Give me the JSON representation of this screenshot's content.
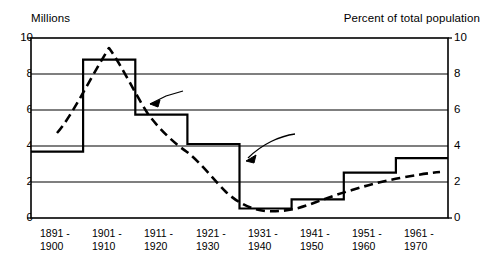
{
  "chart_data": {
    "type": "line",
    "title": "",
    "categories": [
      "1891 -\n1900",
      "1901 -\n1910",
      "1911 -\n1920",
      "1921 -\n1930",
      "1931 -\n1940",
      "1941 -\n1950",
      "1951 -\n1960",
      "1961 -\n1970"
    ],
    "category_lines": [
      [
        "1891 -",
        "1900"
      ],
      [
        "1901 -",
        "1910"
      ],
      [
        "1911 -",
        "1920"
      ],
      [
        "1921 -",
        "1930"
      ],
      [
        "1931 -",
        "1940"
      ],
      [
        "1941 -",
        "1950"
      ],
      [
        "1951 -",
        "1960"
      ],
      [
        "1961 -",
        "1970"
      ]
    ],
    "series": [
      {
        "name": "Number (left scale)",
        "style": "step",
        "axis": "left",
        "unit": "Millions",
        "values": [
          3.69,
          8.8,
          5.74,
          4.11,
          0.53,
          1.04,
          2.52,
          3.32
        ]
      },
      {
        "name": "Percent (right scale)",
        "style": "dashed-line",
        "axis": "right",
        "unit": "Percent of total population",
        "values": [
          5.3,
          9.6,
          4.0,
          1.9,
          0.4,
          0.6,
          1.2,
          1.6
        ],
        "point_values": [
          4.7,
          9.6,
          4.0,
          1.9,
          0.35,
          0.7,
          1.3,
          1.7
        ]
      }
    ],
    "ylabel_left": "Millions",
    "ylabel_right": "Percent of total population",
    "ylim_left": [
      0,
      10
    ],
    "ylim_right": [
      0,
      10
    ],
    "yticks_left": [
      "0",
      "2",
      "4",
      "6",
      "8",
      "10"
    ],
    "yticks_right": [
      "0",
      "2",
      "4",
      "6",
      "8",
      "10"
    ],
    "ytick_values": [
      0,
      2,
      4,
      6,
      8,
      10
    ],
    "grid": true,
    "legend": "annotations",
    "annotations": [
      {
        "text": "Percent (right scale)",
        "target": "percent-series"
      },
      {
        "text": "Number (left scale)",
        "target": "number-series"
      }
    ]
  },
  "axes": {
    "left_title": "Millions",
    "right_title": "Percent of total population"
  },
  "annotations": {
    "percent": "Percent (right scale)",
    "number": "Number (left scale)"
  },
  "colors": {
    "line": "#000000",
    "grid": "#000000",
    "background": "#ffffff"
  }
}
